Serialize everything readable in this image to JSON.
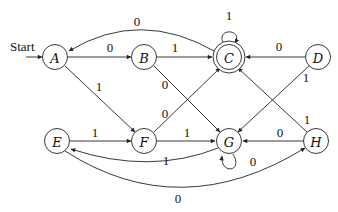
{
  "diagram": {
    "type": "finite-automaton",
    "start_label": "Start",
    "start_state": "A",
    "states": [
      {
        "id": "A",
        "label": "A",
        "accepting": false
      },
      {
        "id": "B",
        "label": "B",
        "accepting": false
      },
      {
        "id": "C",
        "label": "C",
        "accepting": true
      },
      {
        "id": "D",
        "label": "D",
        "accepting": false
      },
      {
        "id": "E",
        "label": "E",
        "accepting": false
      },
      {
        "id": "F",
        "label": "F",
        "accepting": false
      },
      {
        "id": "G",
        "label": "G",
        "accepting": false
      },
      {
        "id": "H",
        "label": "H",
        "accepting": false
      }
    ],
    "transitions": [
      {
        "from": "A",
        "to": "B",
        "label": "0"
      },
      {
        "from": "A",
        "to": "F",
        "label": "1"
      },
      {
        "from": "B",
        "to": "C",
        "label": "1"
      },
      {
        "from": "B",
        "to": "G",
        "label": "0"
      },
      {
        "from": "C",
        "to": "A",
        "label": "0"
      },
      {
        "from": "C",
        "to": "C",
        "label": "1"
      },
      {
        "from": "D",
        "to": "C",
        "label": "0"
      },
      {
        "from": "D",
        "to": "G",
        "label": "1"
      },
      {
        "from": "E",
        "to": "F",
        "label": "1"
      },
      {
        "from": "E",
        "to": "H",
        "label": "0"
      },
      {
        "from": "F",
        "to": "C",
        "label": "0"
      },
      {
        "from": "F",
        "to": "G",
        "label": "1"
      },
      {
        "from": "G",
        "to": "E",
        "label": "1"
      },
      {
        "from": "G",
        "to": "G",
        "label": "0"
      },
      {
        "from": "H",
        "to": "G",
        "label": "0"
      },
      {
        "from": "H",
        "to": "C",
        "label": "1"
      }
    ]
  }
}
